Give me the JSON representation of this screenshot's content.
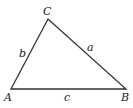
{
  "diagram": {
    "type": "triangle",
    "stroke_color": "#333333",
    "vertices": {
      "A": {
        "label": "A",
        "x": 11,
        "y": 89
      },
      "B": {
        "label": "B",
        "x": 126,
        "y": 89
      },
      "C": {
        "label": "C",
        "x": 48,
        "y": 19
      }
    },
    "sides": {
      "a": {
        "label": "a",
        "between": [
          "B",
          "C"
        ]
      },
      "b": {
        "label": "b",
        "between": [
          "A",
          "C"
        ]
      },
      "c": {
        "label": "c",
        "between": [
          "A",
          "B"
        ]
      }
    }
  }
}
